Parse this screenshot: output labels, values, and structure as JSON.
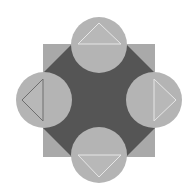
{
  "diagram": {
    "type": "geometric-figure",
    "colors": {
      "background": "#ffffff",
      "square": "#a9a9a9",
      "octagon": "#555555",
      "circle": "#b4b4b4",
      "triangle_fill": "#b8b8b8",
      "triangle_edge": "#e6e6e6",
      "triangle_dark_edge": "#6e6e6e"
    },
    "square": {
      "x": 43,
      "y": 44,
      "w": 112,
      "h": 113
    },
    "octagon_points": "72,44 126,44 155,73 155,128 126,157 72,157 43,128 43,73",
    "circles": [
      {
        "name": "top",
        "cx": 99,
        "cy": 45,
        "r": 28
      },
      {
        "name": "left",
        "cx": 44,
        "cy": 100,
        "r": 28
      },
      {
        "name": "right",
        "cx": 154,
        "cy": 100,
        "r": 28
      },
      {
        "name": "bottom",
        "cx": 99,
        "cy": 155,
        "r": 28
      }
    ],
    "triangles": [
      {
        "name": "top",
        "points": "78,44 99,23 121,44"
      },
      {
        "name": "left",
        "points": "43,79 22,100 43,121"
      },
      {
        "name": "right",
        "points": "154,79 176,100 154,121"
      },
      {
        "name": "bottom",
        "points": "78,155 99,177 121,155"
      }
    ]
  }
}
